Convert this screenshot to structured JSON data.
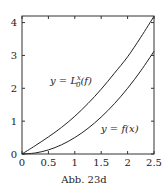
{
  "chart_data": {
    "type": "line",
    "title": "",
    "caption": "Abb. 23d",
    "xlabel": "",
    "ylabel": "",
    "xlim": [
      0,
      2.5
    ],
    "ylim": [
      0,
      4.2
    ],
    "grid": false,
    "x_ticks": [
      0,
      0.5,
      1,
      1.5,
      2,
      2.5
    ],
    "x_tick_labels": [
      "0",
      "0.5",
      "1",
      "1.5",
      "2",
      "2.5"
    ],
    "y_ticks": [
      0,
      1,
      2,
      3,
      4
    ],
    "y_tick_labels": [
      "0",
      "1",
      "2",
      "3",
      "4"
    ],
    "x": [
      0,
      0.25,
      0.5,
      0.75,
      1.0,
      1.25,
      1.5,
      1.75,
      2.0,
      2.25,
      2.5
    ],
    "series": [
      {
        "name": "y = L_0^x(f)",
        "label_text": "y = L",
        "label_sup": "x",
        "label_sub": "0",
        "label_tail": "(f)",
        "values": [
          0,
          0.253,
          0.52,
          0.811,
          1.148,
          1.537,
          1.973,
          2.458,
          2.958,
          3.554,
          4.19
        ]
      },
      {
        "name": "y = f(x)",
        "label_text": "y = f(x)",
        "values": [
          0,
          0.031,
          0.125,
          0.281,
          0.5,
          0.781,
          1.125,
          1.531,
          2.0,
          2.531,
          3.125
        ]
      }
    ],
    "annotations": [
      "y = L_0^x(f)",
      "y = f(x)"
    ],
    "legend": "none (inline curve labels)"
  }
}
